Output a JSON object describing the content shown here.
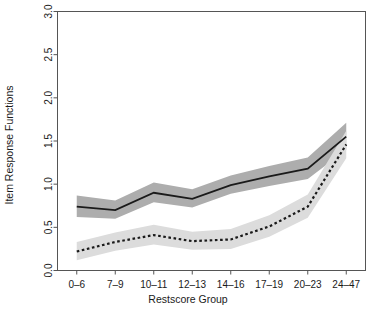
{
  "chart_data": {
    "type": "line",
    "title": "",
    "xlabel": "Restscore Group",
    "ylabel": "Item Response Functions",
    "categories": [
      "0–6",
      "7–9",
      "10–11",
      "12–13",
      "14–16",
      "17–19",
      "20–23",
      "24–47"
    ],
    "ytick_labels": [
      "0.0",
      "0.5",
      "1.0",
      "1.5",
      "2.0",
      "2.5",
      "3.0"
    ],
    "ytick_values": [
      0.0,
      0.5,
      1.0,
      1.5,
      2.0,
      2.5,
      3.0
    ],
    "ylim": [
      0.0,
      3.0
    ],
    "grid": false,
    "legend": "none",
    "series": [
      {
        "name": "solid-curve",
        "style": "solid",
        "color": "#1a1a1a",
        "band_color": "#adadad",
        "values": [
          0.74,
          0.7,
          0.9,
          0.83,
          0.99,
          1.09,
          1.18,
          1.55
        ],
        "band_lower": [
          0.62,
          0.6,
          0.79,
          0.73,
          0.89,
          0.98,
          1.06,
          1.4
        ],
        "band_upper": [
          0.87,
          0.81,
          1.02,
          0.94,
          1.1,
          1.21,
          1.31,
          1.71
        ]
      },
      {
        "name": "dotted-curve",
        "style": "dotted",
        "color": "#1a1a1a",
        "band_color": "#dcdcdc",
        "values": [
          0.22,
          0.33,
          0.41,
          0.34,
          0.36,
          0.51,
          0.74,
          1.46
        ],
        "band_lower": [
          0.12,
          0.23,
          0.3,
          0.24,
          0.25,
          0.39,
          0.61,
          1.3
        ],
        "band_upper": [
          0.33,
          0.44,
          0.53,
          0.45,
          0.48,
          0.64,
          0.88,
          1.62
        ]
      }
    ],
    "axis_color": "#555555",
    "background": "#ffffff"
  }
}
